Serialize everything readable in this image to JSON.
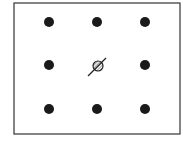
{
  "diagram": {
    "frame": {
      "x": 14,
      "y": 3,
      "width": 166,
      "height": 131,
      "stroke": "#333333"
    },
    "dot_color": "#1a1a1a",
    "dot_radius": 5,
    "dots": [
      {
        "x": 49,
        "y": 22
      },
      {
        "x": 97,
        "y": 22
      },
      {
        "x": 145,
        "y": 22
      },
      {
        "x": 49,
        "y": 65
      },
      {
        "x": 145,
        "y": 65
      },
      {
        "x": 49,
        "y": 109
      },
      {
        "x": 97,
        "y": 109
      },
      {
        "x": 145,
        "y": 109
      }
    ],
    "center_marker": {
      "x": 98,
      "y": 66,
      "radius": 5,
      "type": "hatched-circle-with-arrow",
      "arrow": {
        "x1": 88,
        "y1": 76,
        "x2": 106,
        "y2": 58
      }
    }
  }
}
